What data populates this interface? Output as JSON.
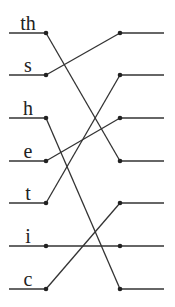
{
  "diagram": {
    "type": "permutation-mapping",
    "left_labels": [
      "th",
      "s",
      "h",
      "e",
      "t",
      "i",
      "c"
    ],
    "connections": [
      {
        "from": 0,
        "to": 3
      },
      {
        "from": 1,
        "to": 0
      },
      {
        "from": 2,
        "to": 6
      },
      {
        "from": 3,
        "to": 2
      },
      {
        "from": 4,
        "to": 1
      },
      {
        "from": 5,
        "to": 5
      },
      {
        "from": 6,
        "to": 4
      }
    ],
    "right_slots": 7
  },
  "layout": {
    "rows_y": [
      33,
      75,
      118,
      161,
      203,
      246,
      289
    ],
    "left_line_x1": 9,
    "left_dot_x": 46,
    "right_dot_x": 120,
    "right_line_x2": 164,
    "label_x": 28
  }
}
